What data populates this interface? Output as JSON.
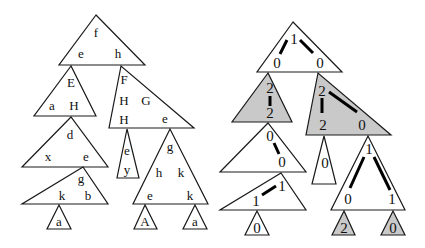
{
  "left_tree": {
    "nodes": [
      {
        "id": "L1",
        "points": "96,15 59,65 145,65",
        "gray": false,
        "labels": [
          {
            "t": "f",
            "x": 96,
            "y": 37
          },
          {
            "t": "e",
            "x": 81,
            "y": 58
          },
          {
            "t": "h",
            "x": 118,
            "y": 58
          }
        ]
      },
      {
        "id": "L2",
        "points": "71,66 34,116 96,116",
        "gray": false,
        "labels": [
          {
            "t": "E",
            "x": 71,
            "y": 87
          },
          {
            "t": "a",
            "x": 52,
            "y": 110
          },
          {
            "t": "H",
            "x": 74,
            "y": 110
          }
        ]
      },
      {
        "id": "L3",
        "points": "121,66 109,128 194,128",
        "gray": false,
        "labels": [
          {
            "t": "F",
            "x": 124,
            "y": 84
          },
          {
            "t": "H",
            "x": 124,
            "y": 105
          },
          {
            "t": "G",
            "x": 146,
            "y": 105
          },
          {
            "t": "H",
            "x": 124,
            "y": 124
          },
          {
            "t": "e",
            "x": 165,
            "y": 123
          }
        ]
      },
      {
        "id": "L4",
        "points": "71,117 22,167 108,167",
        "gray": false,
        "labels": [
          {
            "t": "d",
            "x": 70,
            "y": 139
          },
          {
            "t": "x",
            "x": 48,
            "y": 161
          },
          {
            "t": "e",
            "x": 86,
            "y": 161
          }
        ]
      },
      {
        "id": "L5",
        "points": "127,129 117,178 139,178",
        "gray": false,
        "labels": [
          {
            "t": "e",
            "x": 127,
            "y": 155
          },
          {
            "t": "y",
            "x": 127,
            "y": 174
          }
        ]
      },
      {
        "id": "L6",
        "points": "170,129 133,204 208,204",
        "gray": false,
        "labels": [
          {
            "t": "g",
            "x": 170,
            "y": 151
          },
          {
            "t": "h",
            "x": 159,
            "y": 177
          },
          {
            "t": "k",
            "x": 181,
            "y": 177
          },
          {
            "t": "e",
            "x": 150,
            "y": 200
          },
          {
            "t": "k",
            "x": 190,
            "y": 200
          }
        ]
      },
      {
        "id": "L7",
        "points": "83,167 22,204 108,204",
        "gray": false,
        "labels": [
          {
            "t": "g",
            "x": 81,
            "y": 183
          },
          {
            "t": "k",
            "x": 62,
            "y": 200
          },
          {
            "t": "b",
            "x": 88,
            "y": 200
          }
        ]
      },
      {
        "id": "L8",
        "points": "59,205 47,229 71,229",
        "gray": false,
        "labels": [
          {
            "t": "a",
            "x": 59,
            "y": 226
          }
        ]
      },
      {
        "id": "L9",
        "points": "145,205 134,229 157,229",
        "gray": false,
        "labels": [
          {
            "t": "A",
            "x": 145,
            "y": 226
          }
        ]
      },
      {
        "id": "L10",
        "points": "195,205 183,229 207,229",
        "gray": false,
        "labels": [
          {
            "t": "a",
            "x": 195,
            "y": 226
          }
        ]
      }
    ]
  },
  "right_tree": {
    "nodes": [
      {
        "id": "R1",
        "points": "293,22 257,72 342,72",
        "gray": false,
        "labels": [
          {
            "t": "1",
            "x": 294,
            "y": 44
          },
          {
            "t": "0",
            "x": 277,
            "y": 68
          },
          {
            "t": "0",
            "x": 320,
            "y": 68
          }
        ],
        "edges": [
          [
            287,
            40,
            280,
            54
          ],
          [
            300,
            40,
            313,
            53
          ]
        ]
      },
      {
        "id": "R2",
        "points": "268,73 232,122 292,122",
        "gray": true,
        "labels": [
          {
            "t": "2",
            "x": 270,
            "y": 93
          },
          {
            "t": "2",
            "x": 270,
            "y": 118
          }
        ],
        "edges": [
          [
            270,
            96,
            270,
            106
          ]
        ]
      },
      {
        "id": "R3",
        "points": "318,73 306,135 391,135",
        "gray": true,
        "labels": [
          {
            "t": "2",
            "x": 322,
            "y": 96
          },
          {
            "t": "2",
            "x": 323,
            "y": 130
          },
          {
            "t": "0",
            "x": 362,
            "y": 130
          }
        ],
        "edges": [
          [
            322,
            98,
            322,
            113
          ],
          [
            329,
            92,
            357,
            112
          ]
        ]
      },
      {
        "id": "R4",
        "points": "268,123 220,172 306,172",
        "gray": false,
        "labels": [
          {
            "t": "0",
            "x": 270,
            "y": 141
          },
          {
            "t": "0",
            "x": 282,
            "y": 167
          }
        ],
        "edges": [
          [
            274,
            143,
            279,
            154
          ]
        ]
      },
      {
        "id": "R5",
        "points": "324,136 312,184 336,184",
        "gray": false,
        "labels": [
          {
            "t": "0",
            "x": 325,
            "y": 168
          }
        ],
        "edges": []
      },
      {
        "id": "R6",
        "points": "368,136 331,210 405,210",
        "gray": false,
        "labels": [
          {
            "t": "1",
            "x": 369,
            "y": 154
          },
          {
            "t": "0",
            "x": 348,
            "y": 204
          },
          {
            "t": "1",
            "x": 392,
            "y": 204
          }
        ],
        "edges": [
          [
            364,
            157,
            350,
            188
          ],
          [
            374,
            157,
            390,
            190
          ]
        ]
      },
      {
        "id": "R7",
        "points": "281,173 220,210 306,210",
        "gray": false,
        "labels": [
          {
            "t": "1",
            "x": 282,
            "y": 191
          },
          {
            "t": "1",
            "x": 256,
            "y": 206
          }
        ],
        "edges": [
          [
            262,
            195,
            276,
            186
          ]
        ]
      },
      {
        "id": "R8",
        "points": "257,211 245,235 269,235",
        "gray": false,
        "labels": [
          {
            "t": "0",
            "x": 257,
            "y": 233
          }
        ],
        "edges": []
      },
      {
        "id": "R9",
        "points": "344,211 332,235 355,235",
        "gray": true,
        "labels": [
          {
            "t": "2",
            "x": 344,
            "y": 233
          }
        ],
        "edges": []
      },
      {
        "id": "R10",
        "points": "393,211 381,235 405,235",
        "gray": true,
        "labels": [
          {
            "t": "0",
            "x": 393,
            "y": 233
          }
        ],
        "edges": []
      }
    ]
  },
  "colors": {
    "stroke": "#1a1a1a",
    "gray_fill": "#c9c9c9",
    "background": "#ffffff"
  }
}
